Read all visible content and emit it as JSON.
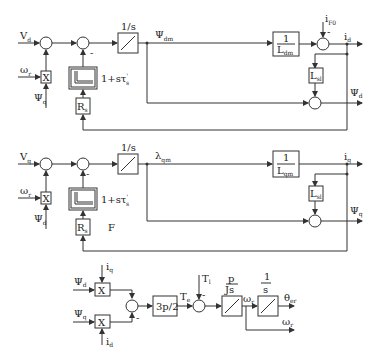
{
  "diagram": {
    "title": "",
    "d_axis": {
      "input_voltage": "V",
      "input_voltage_sub": "d",
      "speed": "ω",
      "speed_sub": "r",
      "cross_flux": "Ψ",
      "cross_flux_sub": "q",
      "multiply": "X",
      "integrator": "1/s",
      "lag_label": "1+sτ",
      "lag_label_sub": "s",
      "lag_label_prime": "'",
      "resistance": "R",
      "resistance_sub": "s",
      "minus_sign": "-",
      "mutual_flux": "Ψ",
      "mutual_flux_sub": "dm",
      "inv_inductance_num": "1",
      "inv_inductance_den": "L",
      "inv_inductance_den_sub": "dm",
      "field_current": "i",
      "field_current_sub": "F0",
      "field_minus": "-",
      "current": "i",
      "current_sub": "d",
      "leakage": "L",
      "leakage_sub": "sl",
      "flux": "Ψ",
      "flux_sub": "d"
    },
    "q_axis": {
      "input_voltage": "V",
      "input_voltage_sub": "q",
      "speed": "ω",
      "speed_sub": "r",
      "cross_flux": "Ψ",
      "cross_flux_sub": "d",
      "multiply": "X",
      "integrator": "1/s",
      "lag_label": "1+sτ",
      "lag_label_sub": "s",
      "lag_label_prime": "'",
      "resistance": "R",
      "resistance_sub": "s",
      "minus_sign": "-",
      "extra_label": "F",
      "mutual_flux": "λ",
      "mutual_flux_sub": "qm",
      "inv_inductance_num": "1",
      "inv_inductance_den": "L",
      "inv_inductance_den_sub": "qm",
      "current": "i",
      "current_sub": "q",
      "leakage": "L",
      "leakage_sub": "sl",
      "flux": "Ψ",
      "flux_sub": "q"
    },
    "mechanical": {
      "flux_d": "Ψ",
      "flux_d_sub": "d",
      "current_q": "i",
      "current_q_sub": "q",
      "flux_q": "Ψ",
      "flux_q_sub": "q",
      "current_d": "i",
      "current_d_sub": "d",
      "multiply": "X",
      "minus_sign": "-",
      "torque_gain": "3p/2",
      "torque": "T",
      "torque_sub": "e",
      "load_torque": "T",
      "load_torque_sub": "l",
      "load_minus": "-",
      "speed_gain_num": "p",
      "speed_gain_den": "Js",
      "speed": "ω",
      "speed_sub": "r",
      "angle_integrator_num": "1",
      "angle_integrator_den": "s",
      "angle": "θ",
      "angle_sub": "er",
      "speed_out": "ω",
      "speed_out_sub": "r"
    }
  }
}
